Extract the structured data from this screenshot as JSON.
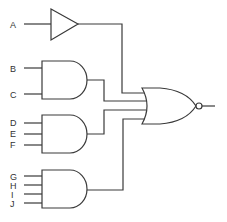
{
  "diagram": {
    "type": "logic-circuit",
    "colors": {
      "line": "#3a3a3a",
      "text": "#333333",
      "background": "#ffffff"
    },
    "inputs": [
      "A",
      "B",
      "C",
      "D",
      "E",
      "F",
      "G",
      "H",
      "I",
      "J"
    ],
    "gates": [
      {
        "id": "buffer",
        "kind": "BUFFER",
        "inputs": [
          "A"
        ]
      },
      {
        "id": "and1",
        "kind": "AND",
        "inputs": [
          "B",
          "C"
        ]
      },
      {
        "id": "and2",
        "kind": "AND",
        "inputs": [
          "D",
          "E",
          "F"
        ]
      },
      {
        "id": "and3",
        "kind": "AND",
        "inputs": [
          "G",
          "H",
          "I",
          "J"
        ]
      },
      {
        "id": "nor",
        "kind": "NOR",
        "inputs": [
          "buffer",
          "and1",
          "and2",
          "and3"
        ]
      }
    ],
    "labels": {
      "a": "A",
      "b": "B",
      "c": "C",
      "d": "D",
      "e": "E",
      "f": "F",
      "g": "G",
      "h": "H",
      "i": "I",
      "j": "J"
    }
  }
}
